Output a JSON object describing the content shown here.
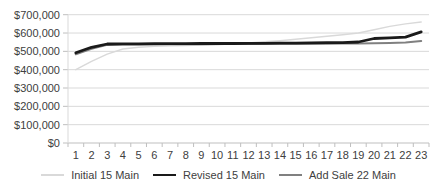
{
  "chart_data": {
    "type": "line",
    "title": "",
    "xlabel": "",
    "ylabel": "",
    "grid": true,
    "legend_position": "bottom",
    "ylim": [
      0,
      700000
    ],
    "y_tick_step": 100000,
    "y_tick_labels": [
      "$0",
      "$100,000",
      "$200,000",
      "$300,000",
      "$400,000",
      "$500,000",
      "$600,000",
      "$700,000"
    ],
    "categories": [
      "1",
      "2",
      "3",
      "4",
      "5",
      "6",
      "7",
      "8",
      "9",
      "10",
      "11",
      "12",
      "13",
      "14",
      "15",
      "16",
      "17",
      "18",
      "19",
      "20",
      "21",
      "22",
      "23"
    ],
    "series": [
      {
        "name": "Initial 15 Main",
        "color": "#d9d9d9",
        "stroke_width": 1.4,
        "values": [
          400000,
          445000,
          485000,
          513000,
          522000,
          527000,
          530000,
          532000,
          534000,
          536000,
          541000,
          546000,
          552000,
          558000,
          566000,
          574000,
          582000,
          591000,
          600000,
          618000,
          636000,
          650000,
          660000
        ]
      },
      {
        "name": "Revised 15 Main",
        "color": "#1a1a1a",
        "stroke_width": 2.8,
        "values": [
          492000,
          522000,
          540000,
          541000,
          541000,
          542000,
          542000,
          542000,
          543000,
          543000,
          543000,
          544000,
          544000,
          545000,
          545000,
          546000,
          547000,
          548000,
          551000,
          570000,
          574000,
          577000,
          606000
        ]
      },
      {
        "name": "Add Sale 22 Main",
        "color": "#808080",
        "stroke_width": 2,
        "values": [
          484000,
          514000,
          535000,
          537000,
          538000,
          538000,
          539000,
          539000,
          539000,
          540000,
          540000,
          540000,
          541000,
          541000,
          541000,
          542000,
          542000,
          543000,
          543000,
          544000,
          546000,
          548000,
          556000
        ]
      }
    ],
    "colors": {
      "gridline": "#d9d9d9",
      "axis_line": "#bfbfbf",
      "tick_mark": "#bfbfbf",
      "axis_text": "#404040",
      "background": "#ffffff"
    }
  },
  "legend": {
    "items": [
      {
        "label": "Initial 15 Main"
      },
      {
        "label": "Revised 15 Main"
      },
      {
        "label": "Add Sale 22 Main"
      }
    ]
  }
}
